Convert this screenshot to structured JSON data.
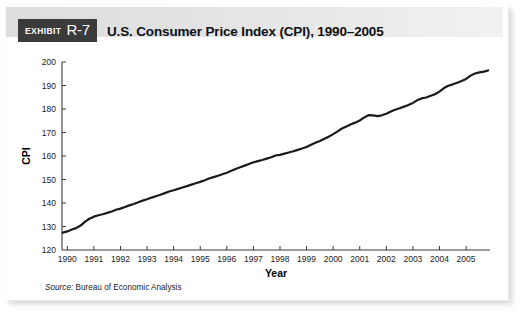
{
  "header": {
    "exhibit_word": "EXHIBIT",
    "exhibit_number": "R-7",
    "title": "U.S. Consumer Price Index (CPI), 1990–2005"
  },
  "footer": {
    "source_label": "Source:",
    "source_text": " Bureau of Economic Analysis"
  },
  "colors": {
    "badge_bg": "#3b3b3b",
    "badge_text": "#ffffff",
    "band_left": "#dddddd",
    "band_right": "#f2f2f2",
    "line": "#1a1a1a",
    "axis": "#3a3a3a",
    "page_bg": "#ffffff"
  },
  "chart_data": {
    "type": "line",
    "title": "U.S. Consumer Price Index (CPI), 1990–2005",
    "xlabel": "Year",
    "ylabel": "CPI",
    "xlim": [
      1989.8,
      2005.9
    ],
    "ylim": [
      120,
      200
    ],
    "ytick_values": [
      120,
      130,
      140,
      150,
      160,
      170,
      180,
      190,
      200
    ],
    "ytick_labels": [
      "120",
      "130",
      "140",
      "150",
      "160",
      "170",
      "180",
      "190",
      "200"
    ],
    "xtick_values": [
      1990,
      1991,
      1992,
      1993,
      1994,
      1995,
      1996,
      1997,
      1998,
      1999,
      2000,
      2001,
      2002,
      2003,
      2004,
      2005
    ],
    "xtick_labels": [
      "1990",
      "1991",
      "1992",
      "1993",
      "1994",
      "1995",
      "1996",
      "1997",
      "1998",
      "1999",
      "2000",
      "2001",
      "2002",
      "2003",
      "2004",
      "2005"
    ],
    "grid": false,
    "legend": false,
    "series": [
      {
        "name": "CPI",
        "x": [
          1989.83,
          1990.0,
          1990.17,
          1990.33,
          1990.5,
          1990.67,
          1990.83,
          1991.0,
          1991.17,
          1991.33,
          1991.5,
          1991.67,
          1991.83,
          1992.0,
          1992.17,
          1992.33,
          1992.5,
          1992.67,
          1992.83,
          1993.0,
          1993.17,
          1993.33,
          1993.5,
          1993.67,
          1993.83,
          1994.0,
          1994.17,
          1994.33,
          1994.5,
          1994.67,
          1994.83,
          1995.0,
          1995.17,
          1995.33,
          1995.5,
          1995.67,
          1995.83,
          1996.0,
          1996.17,
          1996.33,
          1996.5,
          1996.67,
          1996.83,
          1997.0,
          1997.17,
          1997.33,
          1997.5,
          1997.67,
          1997.83,
          1998.0,
          1998.17,
          1998.33,
          1998.5,
          1998.67,
          1998.83,
          1999.0,
          1999.17,
          1999.33,
          1999.5,
          1999.67,
          1999.83,
          2000.0,
          2000.17,
          2000.33,
          2000.5,
          2000.67,
          2000.83,
          2001.0,
          2001.17,
          2001.33,
          2001.5,
          2001.67,
          2001.83,
          2002.0,
          2002.17,
          2002.33,
          2002.5,
          2002.67,
          2002.83,
          2003.0,
          2003.17,
          2003.33,
          2003.5,
          2003.67,
          2003.83,
          2004.0,
          2004.17,
          2004.33,
          2004.5,
          2004.67,
          2004.83,
          2005.0,
          2005.17,
          2005.33,
          2005.5,
          2005.67,
          2005.83
        ],
        "y": [
          127.4,
          127.9,
          128.7,
          129.3,
          130.4,
          132.1,
          133.3,
          134.2,
          134.8,
          135.2,
          135.8,
          136.4,
          137.1,
          137.6,
          138.3,
          139.0,
          139.6,
          140.3,
          141.0,
          141.6,
          142.3,
          142.9,
          143.5,
          144.2,
          144.9,
          145.4,
          146.0,
          146.6,
          147.2,
          147.8,
          148.4,
          149.0,
          149.7,
          150.4,
          151.0,
          151.6,
          152.2,
          152.9,
          153.7,
          154.5,
          155.2,
          155.9,
          156.6,
          157.3,
          157.8,
          158.3,
          158.9,
          159.5,
          160.2,
          160.5,
          161.0,
          161.5,
          162.0,
          162.6,
          163.2,
          163.8,
          164.8,
          165.6,
          166.4,
          167.3,
          168.2,
          169.3,
          170.5,
          171.7,
          172.6,
          173.5,
          174.2,
          175.1,
          176.4,
          177.4,
          177.3,
          177.0,
          177.3,
          178.0,
          178.9,
          179.7,
          180.3,
          181.0,
          181.7,
          182.6,
          183.8,
          184.5,
          184.9,
          185.6,
          186.3,
          187.4,
          188.9,
          189.9,
          190.5,
          191.2,
          191.9,
          192.8,
          194.2,
          195.1,
          195.6,
          195.9,
          196.4
        ]
      }
    ]
  }
}
